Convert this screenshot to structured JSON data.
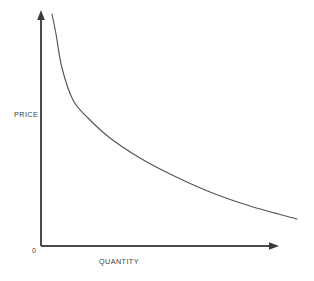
{
  "chart_data": {
    "type": "line",
    "title": "",
    "subtitle": "",
    "xlabel": "QUANTITY",
    "ylabel": "PRICE",
    "origin_label": "0",
    "grid": false,
    "legend": false,
    "legend_position": "none",
    "xlim": [
      0,
      100
    ],
    "ylim": [
      0,
      100
    ],
    "xticks": [],
    "yticks": [],
    "axis_color": "#4a4a4a",
    "curve_color": "#555555",
    "background_color": "#ffffff",
    "annotations": [],
    "series": [
      {
        "name": "Demand",
        "x": [
          5,
          7,
          11,
          16,
          21,
          29,
          40,
          54,
          70,
          85,
          100
        ],
        "y": [
          98,
          86,
          65,
          50,
          42,
          34,
          28,
          22,
          18,
          15,
          13
        ],
        "points_px": [
          [
            52,
            14
          ],
          [
            56,
            34
          ],
          [
            62,
            68
          ],
          [
            73,
            100
          ],
          [
            88,
            118
          ],
          [
            110,
            138
          ],
          [
            140,
            158
          ],
          [
            170,
            174
          ],
          [
            210,
            192
          ],
          [
            250,
            206
          ],
          [
            297,
            219
          ]
        ]
      }
    ]
  },
  "axes": {
    "y_axis_name": "price-axis",
    "x_axis_name": "quantity-axis",
    "y_arrow": "arrow-up",
    "x_arrow": "arrow-right"
  }
}
